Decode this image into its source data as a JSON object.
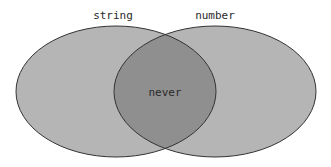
{
  "diagram": {
    "type": "venn",
    "sets": [
      {
        "label": "string",
        "fill": "#b5b5b5"
      },
      {
        "label": "number",
        "fill": "#b5b5b5"
      }
    ],
    "intersection": {
      "label": "never",
      "fill": "#8f8f8f"
    },
    "stroke": "#333333"
  }
}
